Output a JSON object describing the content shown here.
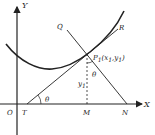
{
  "diagram": {
    "labels": {
      "y_axis": "Y",
      "x_axis": "X",
      "origin": "O",
      "tangent_intercept": "T",
      "foot": "M",
      "normal_intercept": "N",
      "normal_end": "Q",
      "tangent_end": "R",
      "point": "P",
      "point_sub": "1",
      "point_coords_open": "(x",
      "point_coords_sub1": "1",
      "point_coords_mid": ",y",
      "point_coords_sub2": "1",
      "point_coords_close": ")",
      "ordinate": "y",
      "ordinate_sub": "1",
      "angle_at_T": "θ",
      "angle_at_P": "θ"
    },
    "colors": {
      "ink": "#222222",
      "background": "#ffffff"
    }
  }
}
